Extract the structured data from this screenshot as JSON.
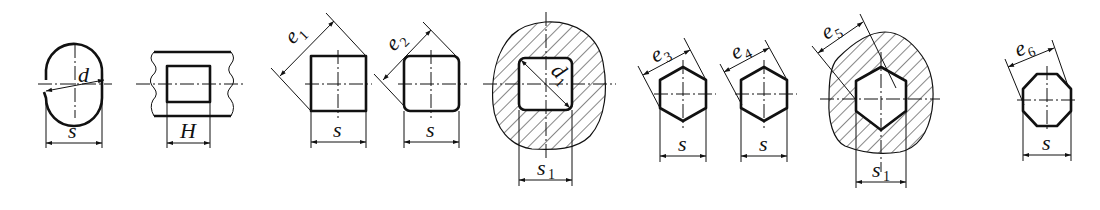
{
  "figure": {
    "background": "#ffffff",
    "ink": "#111111"
  },
  "shapes": [
    {
      "id": "circle-flats",
      "labels": {
        "diameter": "d",
        "width": "s"
      }
    },
    {
      "id": "slot",
      "labels": {
        "width": "H"
      }
    },
    {
      "id": "square",
      "labels": {
        "diagonal": "e",
        "diagonal_sub": "1",
        "width": "s"
      }
    },
    {
      "id": "rounded-square",
      "labels": {
        "diagonal": "e",
        "diagonal_sub": "2",
        "width": "s"
      }
    },
    {
      "id": "square-socket",
      "labels": {
        "diameter": "d",
        "diameter_sub": "1",
        "width": "s",
        "width_sub": "1"
      }
    },
    {
      "id": "hexagon-1",
      "labels": {
        "diagonal": "e",
        "diagonal_sub": "3",
        "width": "s"
      }
    },
    {
      "id": "hexagon-2",
      "labels": {
        "diagonal": "e",
        "diagonal_sub": "4",
        "width": "s"
      }
    },
    {
      "id": "hex-socket",
      "labels": {
        "diagonal": "e",
        "diagonal_sub": "5",
        "width": "s",
        "width_sub": "1"
      }
    },
    {
      "id": "octagon",
      "labels": {
        "diagonal": "e",
        "diagonal_sub": "6",
        "width": "s"
      }
    }
  ]
}
